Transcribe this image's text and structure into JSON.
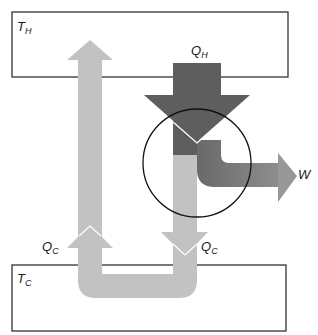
{
  "diagram": {
    "hot_reservoir": {
      "label_main": "T",
      "label_sub": "H"
    },
    "cold_reservoir": {
      "label_main": "T",
      "label_sub": "C"
    },
    "heat_in": {
      "label_main": "Q",
      "label_sub": "H"
    },
    "heat_out_left": {
      "label_main": "Q",
      "label_sub": "C"
    },
    "heat_out_right": {
      "label_main": "Q",
      "label_sub": "C"
    },
    "work": {
      "label_main": "W"
    },
    "colors": {
      "hot_flow": "#5e5e5e",
      "cold_flow": "#c2c2c2",
      "work_flow": "#8a8a8a",
      "outline": "#333333",
      "engine_circle": "#111111"
    }
  }
}
